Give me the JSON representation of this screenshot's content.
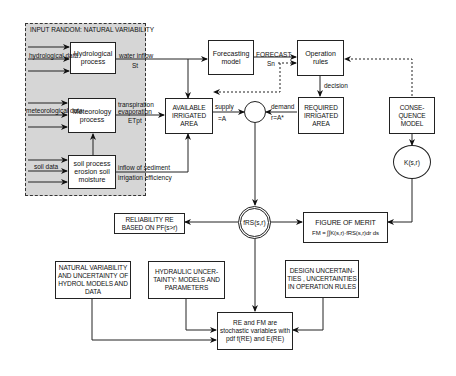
{
  "region": {
    "title": "INPUT RANDOM: NATURAL VARIABILITY"
  },
  "boxes": {
    "hydrological": "Hydrological process",
    "meteorology": "Meteorology process",
    "soil": "soil process erosion soil moisture",
    "forecasting": "Forecasting model",
    "operation": "Operation rules",
    "available": "AVAILABLE IRRIGATED AREA",
    "required": "REQUIRED IRRIGATED AREA",
    "consequence": "CONSE- QUENCE MODEL",
    "reliability": "RELIABILITY RE BASED ON PF(s>r)",
    "merit_title": "FIGURE OF MERIT",
    "merit_formula": "FM = ∫∫K(s,r)·fRS(s,r)dr ds",
    "natural": "NATURAL VARIABILITY AND UNCERTAINTY OF HYDROL MODELS AND DATA",
    "hydraulic": "HYDRAULIC UNCER- TAINTY: MODELS AND PARAMETERS",
    "design": "DESIGN UNCERTAIN- TIES , UNCERTAINTIES IN OPERATION RULES",
    "final": "RE and FM are stochastic variables with pdf f(RE) and E(RE)"
  },
  "circles": {
    "k": "K(s,r)",
    "f": "fRS(s,r)"
  },
  "labels": {
    "hydro_data": "hydrological data",
    "meteo_data": "meteorological data",
    "soil_data": "soil data",
    "water_inflow": "water inflow",
    "water_inflow_sym": "St",
    "transpiration": "transpiration",
    "evaporation": "evaporation",
    "et": "ETpt",
    "sediment": "inflow of sediment",
    "irrigation": "irrigation efficiency",
    "forecast": "FORECAST",
    "forecast_sym": "Sn",
    "decision": "decision",
    "supply": "supply",
    "supply_sym": "=A",
    "demand": "demand",
    "demand_sym": "r=A*"
  }
}
